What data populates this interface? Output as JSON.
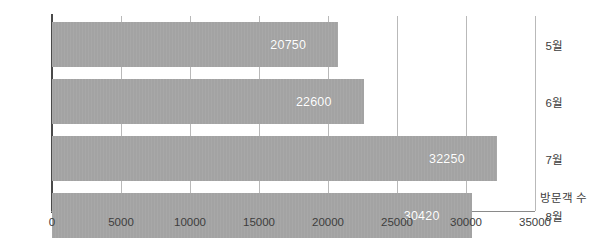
{
  "chart_data": {
    "type": "bar",
    "orientation": "horizontal",
    "title": "",
    "subtitle": "",
    "categories": [
      "5월",
      "6월",
      "7월",
      "8월"
    ],
    "values": [
      20750,
      22600,
      32250,
      30420
    ],
    "data_labels": [
      "20750",
      "22600",
      "32250",
      "30420"
    ],
    "xlabel": "방문객 수",
    "ylabel": "",
    "xlim": [
      0,
      35000
    ],
    "xticks": [
      0,
      5000,
      10000,
      15000,
      20000,
      25000,
      30000,
      35000
    ],
    "xtick_labels": [
      "0",
      "5000",
      "10000",
      "15000",
      "20000",
      "25000",
      "30000",
      "35000"
    ],
    "grid": "vertical",
    "legend": "none",
    "colors": {
      "bar_fill": "#a3a3a3",
      "data_label": "#ffffff",
      "gridline": "#b9b9b9",
      "axis_spine": "#4a4a4a",
      "tick_text": "#3d3d3d",
      "background": "#ffffff"
    }
  }
}
